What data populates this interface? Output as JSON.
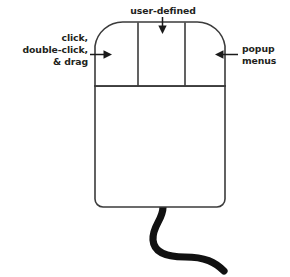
{
  "figure": {
    "type": "diagram",
    "background_color": "#ffffff",
    "outline_color": "#3b3b3b",
    "text_color": "#231f20",
    "cord_color": "#111111"
  },
  "labels": {
    "top": {
      "name": "user-defined",
      "lines": [
        "user-defined"
      ],
      "target": "middle-button",
      "arrow_direction": "down"
    },
    "left": {
      "name": "click-double-click-drag",
      "lines": [
        "click,",
        "double-click,",
        "& drag"
      ],
      "target": "left-button",
      "arrow_direction": "right"
    },
    "right": {
      "name": "popup-menus",
      "lines": [
        "popup",
        "menus"
      ],
      "target": "right-button",
      "arrow_direction": "left"
    }
  },
  "mouse": {
    "buttons": [
      {
        "id": "left-button",
        "function": "click, double-click, & drag"
      },
      {
        "id": "middle-button",
        "function": "user-defined"
      },
      {
        "id": "right-button",
        "function": "popup menus"
      }
    ],
    "body": {
      "id": "mouse-body"
    },
    "cord": {
      "id": "mouse-cord"
    }
  }
}
